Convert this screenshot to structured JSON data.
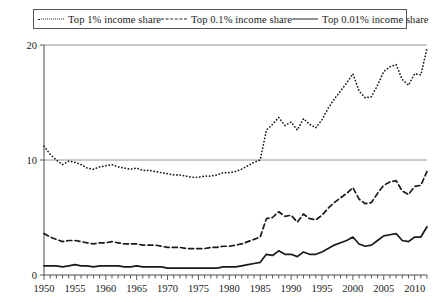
{
  "legend": {
    "position": "top",
    "items": [
      {
        "label": "Top 1% income share",
        "style": "dotted",
        "icon": "dotted-line-swatch"
      },
      {
        "label": "Top 0.1% income share",
        "style": "dashed",
        "icon": "dashed-line-swatch"
      },
      {
        "label": "Top 0.01% income share",
        "style": "solid",
        "icon": "solid-line-swatch"
      }
    ]
  },
  "chart_data": {
    "type": "line",
    "title": "",
    "subtitle": "",
    "xlabel": "",
    "ylabel": "",
    "xlim": [
      1950,
      2012
    ],
    "ylim": [
      0,
      20
    ],
    "yticks": [
      0,
      10,
      20
    ],
    "ytick_labels": [
      "0",
      "10",
      "20"
    ],
    "xticks": [
      1950,
      1955,
      1960,
      1965,
      1970,
      1975,
      1980,
      1985,
      1990,
      1995,
      2000,
      2005,
      2010
    ],
    "xtick_labels": [
      "1950",
      "1955",
      "1960",
      "1965",
      "1970",
      "1975",
      "1980",
      "1985",
      "1990",
      "1995",
      "2000",
      "2005",
      "2010"
    ],
    "minor_xtick_step": 1,
    "grid": "horizontal-at-10-and-20",
    "x": [
      1950,
      1951,
      1952,
      1953,
      1954,
      1955,
      1956,
      1957,
      1958,
      1959,
      1960,
      1961,
      1962,
      1963,
      1964,
      1965,
      1966,
      1967,
      1968,
      1969,
      1970,
      1971,
      1972,
      1973,
      1974,
      1975,
      1976,
      1977,
      1978,
      1979,
      1980,
      1981,
      1982,
      1983,
      1984,
      1985,
      1986,
      1987,
      1988,
      1989,
      1990,
      1991,
      1992,
      1993,
      1994,
      1995,
      1996,
      1997,
      1998,
      1999,
      2000,
      2001,
      2002,
      2003,
      2004,
      2005,
      2006,
      2007,
      2008,
      2009,
      2010,
      2011,
      2012
    ],
    "series": [
      {
        "name": "Top 1% income share",
        "style": "dotted",
        "values": [
          11.2,
          10.5,
          10.0,
          9.6,
          9.9,
          9.8,
          9.6,
          9.3,
          9.2,
          9.4,
          9.5,
          9.6,
          9.4,
          9.3,
          9.2,
          9.3,
          9.1,
          9.1,
          9.0,
          8.9,
          8.8,
          8.7,
          8.7,
          8.6,
          8.5,
          8.5,
          8.6,
          8.6,
          8.7,
          8.9,
          8.9,
          9.0,
          9.2,
          9.5,
          9.8,
          10.0,
          12.6,
          13.1,
          13.7,
          13.0,
          13.3,
          12.6,
          13.6,
          13.1,
          12.8,
          13.5,
          14.5,
          15.3,
          16.0,
          16.7,
          17.5,
          16.0,
          15.4,
          15.5,
          16.5,
          17.7,
          18.1,
          18.3,
          17.0,
          16.5,
          17.5,
          17.4,
          19.7
        ]
      },
      {
        "name": "Top 0.1% income share",
        "style": "dashed",
        "values": [
          3.6,
          3.3,
          3.1,
          2.9,
          3.0,
          3.0,
          2.9,
          2.8,
          2.7,
          2.8,
          2.8,
          2.9,
          2.8,
          2.7,
          2.7,
          2.7,
          2.6,
          2.6,
          2.6,
          2.5,
          2.4,
          2.4,
          2.4,
          2.3,
          2.3,
          2.3,
          2.3,
          2.4,
          2.4,
          2.5,
          2.5,
          2.6,
          2.7,
          2.9,
          3.1,
          3.3,
          4.9,
          5.0,
          5.5,
          5.1,
          5.2,
          4.6,
          5.3,
          4.9,
          4.8,
          5.2,
          5.8,
          6.3,
          6.7,
          7.1,
          7.6,
          6.6,
          6.2,
          6.3,
          7.1,
          7.8,
          8.1,
          8.2,
          7.3,
          7.0,
          7.7,
          7.8,
          9.0
        ]
      },
      {
        "name": "Top 0.01% income share",
        "style": "solid",
        "values": [
          0.8,
          0.8,
          0.8,
          0.7,
          0.8,
          0.9,
          0.8,
          0.8,
          0.7,
          0.8,
          0.8,
          0.8,
          0.8,
          0.7,
          0.7,
          0.8,
          0.7,
          0.7,
          0.7,
          0.7,
          0.6,
          0.6,
          0.6,
          0.6,
          0.6,
          0.6,
          0.6,
          0.6,
          0.6,
          0.7,
          0.7,
          0.7,
          0.8,
          0.9,
          1.0,
          1.1,
          1.8,
          1.7,
          2.1,
          1.8,
          1.8,
          1.6,
          2.0,
          1.8,
          1.8,
          2.0,
          2.3,
          2.6,
          2.8,
          3.0,
          3.3,
          2.7,
          2.5,
          2.6,
          3.0,
          3.4,
          3.5,
          3.6,
          3.0,
          2.9,
          3.3,
          3.3,
          4.2
        ]
      }
    ]
  }
}
